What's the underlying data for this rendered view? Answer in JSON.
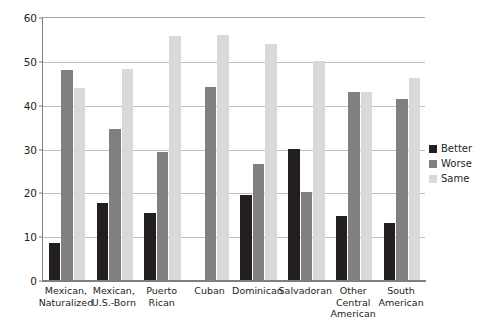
{
  "chart_data": {
    "type": "bar",
    "title": "",
    "subtitle": "",
    "xlabel": "",
    "ylabel": "",
    "ylim": [
      0,
      60
    ],
    "yticks": [
      0,
      10,
      20,
      30,
      40,
      50,
      60
    ],
    "ytick_labels": [
      "0",
      "10",
      "20",
      "30",
      "40",
      "50",
      "60"
    ],
    "grid": true,
    "legend_position": "right",
    "categories": [
      "Mexican, Naturalized",
      "Mexican, U.S.-Born",
      "Puerto Rican",
      "Cuban",
      "Dominican",
      "Salvadoran",
      "Other Central American",
      "South American"
    ],
    "category_lines": [
      [
        "Mexican,",
        "Naturalized"
      ],
      [
        "Mexican,",
        "U.S.-Born"
      ],
      [
        "Puerto",
        "Rican"
      ],
      [
        "Cuban"
      ],
      [
        "Dominican"
      ],
      [
        "Salvadoran"
      ],
      [
        "Other",
        "Central",
        "American"
      ],
      [
        "South",
        "American"
      ]
    ],
    "series": [
      {
        "name": "Better",
        "color": "#231f20",
        "values": [
          8.5,
          17.5,
          15.2,
          0,
          19.5,
          30,
          14.5,
          13
        ]
      },
      {
        "name": "Worse",
        "color": "#808080",
        "values": [
          48,
          34.5,
          29.2,
          44,
          26.5,
          20,
          43,
          41.2
        ]
      },
      {
        "name": "Same",
        "color": "#d9d9d9",
        "values": [
          43.8,
          48.2,
          55.6,
          56,
          53.8,
          50,
          43,
          46.2
        ]
      }
    ]
  },
  "legend": {
    "items": [
      {
        "label": "Better",
        "key": "better"
      },
      {
        "label": "Worse",
        "key": "worse"
      },
      {
        "label": "Same",
        "key": "same"
      }
    ]
  }
}
